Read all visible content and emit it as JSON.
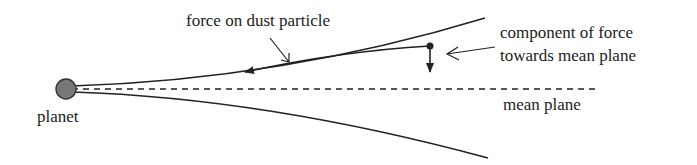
{
  "labels": {
    "force": "force on dust particle",
    "component_line1": "component of force",
    "component_line2": "towards mean plane",
    "mean_plane": "mean plane",
    "planet": "planet"
  },
  "colors": {
    "line": "#222222",
    "planet_fill": "#777777"
  }
}
